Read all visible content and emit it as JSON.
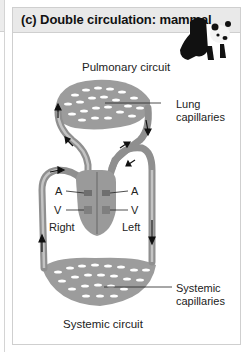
{
  "panel": {
    "title": "(c) Double circulation: mammal",
    "image_icon": "panda-icon"
  },
  "labels": {
    "pulmonary_circuit": "Pulmonary circuit",
    "lung_capillaries_1": "Lung",
    "lung_capillaries_2": "capillaries",
    "atrium_left_side": "A",
    "atrium_right_side": "A",
    "ventricle_left_side": "V",
    "ventricle_right_side": "V",
    "right": "Right",
    "left": "Left",
    "systemic_capillaries_1": "Systemic",
    "systemic_capillaries_2": "capillaries",
    "systemic_circuit": "Systemic circuit"
  },
  "colors": {
    "vessel": "#8f8f8f",
    "vessel_light": "#b8b8b8",
    "heart": "#9a9a9a",
    "arrow": "#111111"
  }
}
